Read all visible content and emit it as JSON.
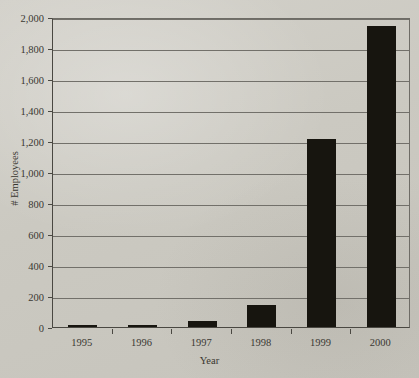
{
  "chart_data": {
    "type": "bar",
    "title": "",
    "xlabel": "Year",
    "ylabel": "# Employees",
    "categories": [
      "1995",
      "1996",
      "1997",
      "1998",
      "1999",
      "2000"
    ],
    "values": [
      10,
      12,
      40,
      145,
      1210,
      1940
    ],
    "ylim": [
      0,
      2000
    ],
    "ytick_labels": [
      "0",
      "200",
      "400",
      "600",
      "800",
      "1,000",
      "1,200",
      "1,400",
      "1,600",
      "1,800",
      "2,000"
    ],
    "ytick_values": [
      0,
      200,
      400,
      600,
      800,
      1000,
      1200,
      1400,
      1600,
      1800,
      2000
    ],
    "grid": true,
    "legend": false,
    "bar_color": "#17150f",
    "gridline_color": "#72706a",
    "background_color": "#cdcbc4"
  }
}
